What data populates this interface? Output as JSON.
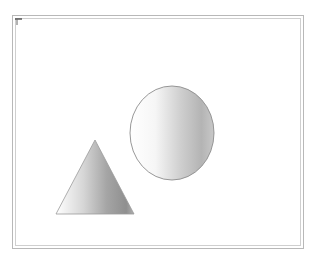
{
  "canvas": {
    "width": 317,
    "height": 257,
    "background": "#ffffff",
    "frame_color_outer": "#b8b8b8",
    "frame_color_inner": "#cfcfcf"
  },
  "shapes": [
    {
      "type": "cone",
      "label": "",
      "apex": [
        95,
        140
      ],
      "base_left": [
        56,
        214
      ],
      "base_right": [
        134,
        214
      ],
      "gradient": [
        "#ffffff",
        "#9a9a9a"
      ]
    },
    {
      "type": "sphere",
      "label": "",
      "center": [
        172,
        133
      ],
      "rx": 42,
      "ry": 47,
      "gradient": [
        "#ffffff",
        "#a8a8a8"
      ]
    }
  ],
  "corner_mark": {
    "icon": "corner-tick-icon",
    "color": "#333333"
  }
}
